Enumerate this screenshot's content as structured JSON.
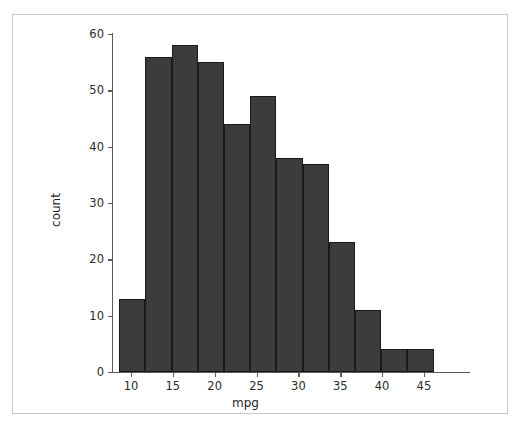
{
  "figure": {
    "background_color": "#ffffff",
    "frame_color": "#c9c9cc",
    "bar_fill_color": "#3c3c3e",
    "bar_edge_color": "#1a1a1c",
    "axis_color": "#5b5b5e"
  },
  "chart_data": {
    "type": "bar",
    "title": "",
    "xlabel": "mpg",
    "ylabel": "count",
    "xlim": [
      6.8,
      49.6
    ],
    "ylim": [
      0,
      62
    ],
    "grid": false,
    "legend": null,
    "xticks": [
      10,
      15,
      20,
      25,
      30,
      35,
      40,
      45
    ],
    "xticklabels": [
      "10",
      "15",
      "20",
      "25",
      "30",
      "35",
      "40",
      "45"
    ],
    "yticks": [
      0,
      10,
      20,
      30,
      40,
      50,
      60
    ],
    "yticklabels": [
      "0",
      "10",
      "20",
      "30",
      "40",
      "50",
      "60"
    ],
    "bin_width": 3.13,
    "bin_edges": [
      8.6,
      11.73,
      14.86,
      17.99,
      21.12,
      24.25,
      27.38,
      30.51,
      33.64,
      36.77,
      39.9,
      43.03,
      46.16
    ],
    "categories": [
      "8.6-11.7",
      "11.7-14.9",
      "14.9-18.0",
      "18.0-21.1",
      "21.1-24.3",
      "24.3-27.4",
      "27.4-30.5",
      "30.5-33.6",
      "33.6-36.8",
      "36.8-39.9",
      "39.9-43.0",
      "43.0-46.2"
    ],
    "values": [
      13,
      56,
      58,
      55,
      44,
      49,
      38,
      37,
      23,
      11,
      4,
      4
    ]
  }
}
